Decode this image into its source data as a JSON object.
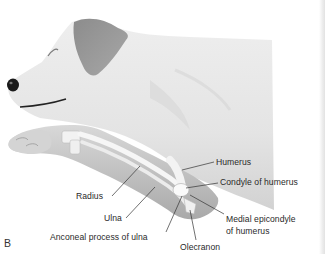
{
  "figure": {
    "panel_letter": "B",
    "colors": {
      "background": "#ffffff",
      "body_fill": "#e6e6e6",
      "body_shadow": "#cfcfcf",
      "ear_fill": "#9a9a9a",
      "limb_fill": "#bdbdbd",
      "bone_fill": "#f4f4f4",
      "leader_line": "#333333",
      "label_text": "#2a2a2a"
    }
  },
  "labels": [
    {
      "id": "humerus",
      "text": "Humerus"
    },
    {
      "id": "condyle",
      "text": "Condyle of humerus"
    },
    {
      "id": "radius",
      "text": "Radius"
    },
    {
      "id": "ulna",
      "text": "Ulna"
    },
    {
      "id": "medial-epicondyle-1",
      "text": "Medial epicondyle"
    },
    {
      "id": "medial-epicondyle-2",
      "text": "of humerus"
    },
    {
      "id": "anconeal",
      "text": "Anconeal process of ulna"
    },
    {
      "id": "olecranon",
      "text": "Olecranon"
    }
  ]
}
